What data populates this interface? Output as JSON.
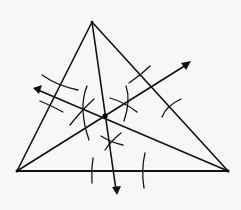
{
  "diagram": {
    "type": "geometric-construction",
    "background": "#f7f7f5",
    "ink_color": "#111111",
    "triangle": {
      "vertices": {
        "top": [
          92,
          22
        ],
        "left": [
          17,
          171
        ],
        "right": [
          228,
          171
        ]
      }
    },
    "incenter": [
      105,
      116
    ],
    "bisectors": [
      {
        "name": "from-top",
        "from": [
          92,
          22
        ],
        "to": [
          117,
          194
        ],
        "arrow": true
      },
      {
        "name": "from-left",
        "from": [
          17,
          171
        ],
        "to": [
          190,
          62
        ],
        "arrow": true
      },
      {
        "name": "from-right",
        "from": [
          228,
          171
        ],
        "to": [
          34,
          88
        ],
        "arrow": true
      }
    ],
    "labels": []
  }
}
